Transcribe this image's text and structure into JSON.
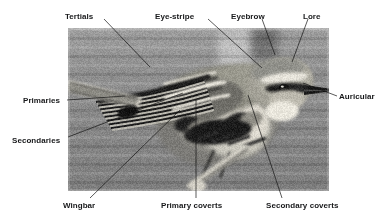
{
  "figure": {
    "kind": "annotated-photograph",
    "photo": {
      "x": 68,
      "y": 28,
      "width": 261,
      "height": 163,
      "palette": {
        "background_sky": "#8a8a8a",
        "background_upper": "#9c9c9c",
        "bird_dark": "#2a2a2a",
        "bird_mid": "#6e6e6e",
        "bird_light": "#d8d6cf",
        "highlight": "#efeee8",
        "frame_border": "#b9b9b9"
      }
    },
    "line_color": "#141414",
    "text_color": "#17181a"
  },
  "labels": [
    {
      "id": "tertials",
      "text": "Tertials",
      "x": 65,
      "y": 12,
      "leader": {
        "x1": 104,
        "y1": 19,
        "x2": 150,
        "y2": 67
      }
    },
    {
      "id": "eye-stripe",
      "text": "Eye-stripe",
      "x": 155,
      "y": 12,
      "leader": {
        "x1": 208,
        "y1": 19,
        "x2": 262,
        "y2": 68
      }
    },
    {
      "id": "eyebrow",
      "text": "Eyebrow",
      "x": 231,
      "y": 12,
      "leader": {
        "x1": 262,
        "y1": 19,
        "x2": 275,
        "y2": 55
      }
    },
    {
      "id": "lore",
      "text": "Lore",
      "x": 303,
      "y": 12,
      "leader": {
        "x1": 308,
        "y1": 19,
        "x2": 292,
        "y2": 62
      }
    },
    {
      "id": "auricular",
      "text": "Auricular",
      "x": 339,
      "y": 92,
      "leader": {
        "x1": 337,
        "y1": 96,
        "x2": 303,
        "y2": 83
      }
    },
    {
      "id": "primaries",
      "text": "Primaries",
      "x": 23,
      "y": 96,
      "leader": {
        "x1": 67,
        "y1": 100,
        "x2": 125,
        "y2": 96
      }
    },
    {
      "id": "secondaries",
      "text": "Secondaries",
      "x": 12,
      "y": 136,
      "leader": {
        "x1": 68,
        "y1": 137,
        "x2": 183,
        "y2": 93
      }
    },
    {
      "id": "wingbar",
      "text": "Wingbar",
      "x": 63,
      "y": 201,
      "leader": {
        "x1": 90,
        "y1": 198,
        "x2": 180,
        "y2": 110
      }
    },
    {
      "id": "primary-coverts",
      "text": "Primary coverts",
      "x": 161,
      "y": 201,
      "leader": {
        "x1": 196,
        "y1": 198,
        "x2": 196,
        "y2": 100
      }
    },
    {
      "id": "secondary-coverts",
      "text": "Secondary coverts",
      "x": 266,
      "y": 201,
      "leader": {
        "x1": 282,
        "y1": 198,
        "x2": 248,
        "y2": 95
      }
    }
  ]
}
